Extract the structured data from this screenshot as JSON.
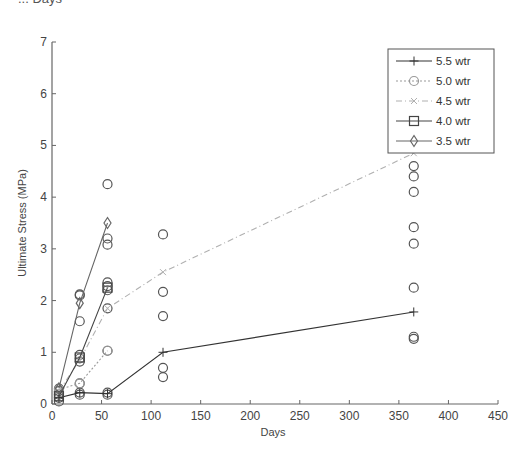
{
  "top_cut_text": "... Days",
  "chart_data": {
    "type": "line",
    "title": "",
    "xlabel": "Days",
    "ylabel": "Ultimate Stress (MPa)",
    "xlim": [
      0,
      450
    ],
    "ylim": [
      0,
      7
    ],
    "xticks": [
      0,
      50,
      100,
      150,
      200,
      250,
      300,
      350,
      400,
      450
    ],
    "yticks": [
      0,
      1,
      2,
      3,
      4,
      5,
      6,
      7
    ],
    "grid": false,
    "legend_position": "upper right",
    "series": [
      {
        "name": "5.5 wtr",
        "marker": "plus",
        "line": "solid",
        "color": "#333333",
        "x": [
          7,
          28,
          56,
          112,
          365
        ],
        "y": [
          0.12,
          0.22,
          0.2,
          1.0,
          1.78
        ]
      },
      {
        "name": "5.0 wtr",
        "marker": "circle",
        "line": "dotted",
        "color": "#999999",
        "x": [
          7,
          28,
          56
        ],
        "y": [
          0.28,
          0.4,
          1.03
        ]
      },
      {
        "name": "4.5 wtr",
        "marker": "x",
        "line": "dashdot",
        "color": "#b0b0b0",
        "x": [
          7,
          28,
          56,
          112,
          365
        ],
        "y": [
          0.25,
          0.85,
          1.85,
          2.55,
          4.85
        ]
      },
      {
        "name": "4.0 wtr",
        "marker": "square",
        "line": "solid",
        "color": "#444444",
        "x": [
          7,
          28,
          56
        ],
        "y": [
          0.15,
          0.9,
          2.25
        ]
      },
      {
        "name": "3.5 wtr",
        "marker": "diamond",
        "line": "solid",
        "color": "#666666",
        "x": [
          7,
          28,
          56
        ],
        "y": [
          0.3,
          1.95,
          3.5
        ]
      }
    ],
    "scatter_points": [
      {
        "x": 7,
        "y": 0.05
      },
      {
        "x": 7,
        "y": 0.12
      },
      {
        "x": 7,
        "y": 0.18
      },
      {
        "x": 7,
        "y": 0.25
      },
      {
        "x": 7,
        "y": 0.3
      },
      {
        "x": 28,
        "y": 2.12
      },
      {
        "x": 28,
        "y": 2.1
      },
      {
        "x": 28,
        "y": 1.6
      },
      {
        "x": 28,
        "y": 0.95
      },
      {
        "x": 28,
        "y": 0.88
      },
      {
        "x": 28,
        "y": 0.82
      },
      {
        "x": 28,
        "y": 0.4
      },
      {
        "x": 28,
        "y": 0.22
      },
      {
        "x": 28,
        "y": 0.18
      },
      {
        "x": 56,
        "y": 4.25
      },
      {
        "x": 56,
        "y": 3.2
      },
      {
        "x": 56,
        "y": 3.08
      },
      {
        "x": 56,
        "y": 2.35
      },
      {
        "x": 56,
        "y": 2.28
      },
      {
        "x": 56,
        "y": 2.2
      },
      {
        "x": 56,
        "y": 1.85
      },
      {
        "x": 56,
        "y": 1.03
      },
      {
        "x": 56,
        "y": 0.22
      },
      {
        "x": 56,
        "y": 0.18
      },
      {
        "x": 112,
        "y": 3.28
      },
      {
        "x": 112,
        "y": 2.17
      },
      {
        "x": 112,
        "y": 1.7
      },
      {
        "x": 112,
        "y": 0.7
      },
      {
        "x": 112,
        "y": 0.52
      },
      {
        "x": 365,
        "y": 4.6
      },
      {
        "x": 365,
        "y": 4.4
      },
      {
        "x": 365,
        "y": 4.1
      },
      {
        "x": 365,
        "y": 3.42
      },
      {
        "x": 365,
        "y": 3.1
      },
      {
        "x": 365,
        "y": 2.25
      },
      {
        "x": 365,
        "y": 1.3
      },
      {
        "x": 365,
        "y": 1.26
      }
    ]
  }
}
